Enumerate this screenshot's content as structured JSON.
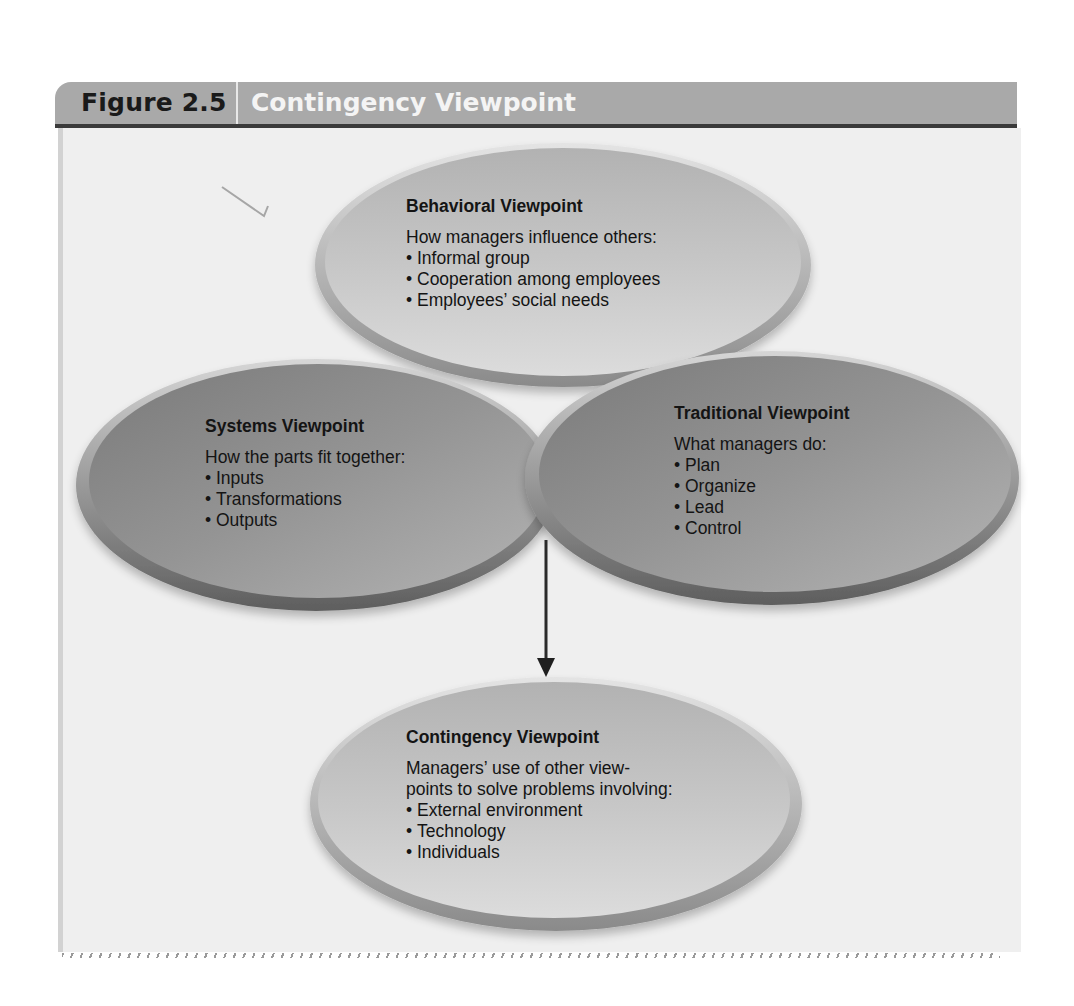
{
  "figure": {
    "number": "Figure 2.5",
    "title": "Contingency Viewpoint"
  },
  "nodes": {
    "behavioral": {
      "title": "Behavioral Viewpoint",
      "description": "How managers influence others:",
      "items": [
        "Informal group",
        "Cooperation among employees",
        "Employees’ social needs"
      ]
    },
    "systems": {
      "title": "Systems Viewpoint",
      "description": "How the parts fit together:",
      "items": [
        "Inputs",
        "Transformations",
        "Outputs"
      ]
    },
    "traditional": {
      "title": "Traditional Viewpoint",
      "description": "What managers do:",
      "items": [
        "Plan",
        "Organize",
        "Lead",
        "Control"
      ]
    },
    "contingency": {
      "title": "Contingency Viewpoint",
      "description_line1": "Managers’ use of other view-",
      "description_line2": "points to solve problems involving:",
      "items": [
        "External environment",
        "Technology",
        "Individuals"
      ]
    }
  },
  "edges": [
    {
      "from": "behavioral+systems+traditional",
      "to": "contingency",
      "type": "arrow"
    }
  ],
  "colors": {
    "header_bg": "#a9a9a9",
    "header_rule": "#3a3a3a",
    "panel_bg": "#efefef",
    "light_ellipse": "#c4c4c4",
    "dark_ellipse": "#8e8e8e",
    "ellipse_rim": "#6e6e6e",
    "arrow": "#2a2a2a"
  }
}
